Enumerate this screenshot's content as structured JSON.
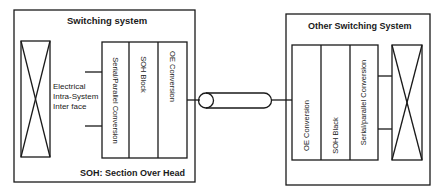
{
  "left_system": {
    "title": "Switching system",
    "interface_label_lines": [
      "Electrical",
      "Intra-System",
      "Inter face"
    ],
    "blocks": [
      "Serial/Parallel Conversion",
      "SOH Block",
      "OE Conversion"
    ],
    "footnote": "SOH: Section Over Head"
  },
  "right_system": {
    "title": "Other Switching System",
    "blocks": [
      "OE Conversion",
      "SOH Black",
      "Serial/parallel Conversion"
    ]
  },
  "link": {
    "type": "optical-fiber-cable"
  },
  "colors": {
    "line": "#1a1a1a",
    "background": "#ffffff"
  }
}
